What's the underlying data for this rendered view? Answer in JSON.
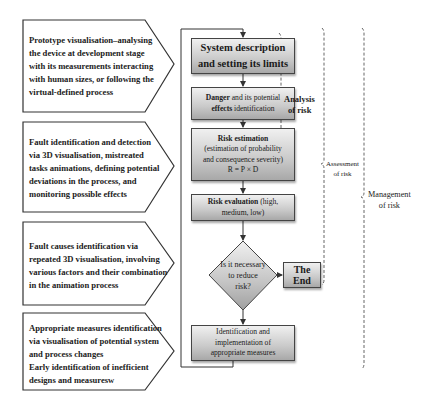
{
  "diagram": {
    "left_panels": [
      {
        "id": "prototype",
        "lines": [
          "Prototype visualisation–analysing",
          "the device at development stage",
          "with its measurements interacting",
          "with human sizes, or following the",
          "virtual-defined process"
        ]
      },
      {
        "id": "fault-identification",
        "lines": [
          "Fault identification and detection",
          "via 3D visualisation, mistreated",
          "tasks animations, defining potential",
          "deviations in the process, and",
          "monitoring possible effects"
        ]
      },
      {
        "id": "fault-causes",
        "lines": [
          "Fault causes identification via",
          "repeated 3D visualisation, involving",
          "various factors and their combination",
          "in the animation process"
        ]
      },
      {
        "id": "appropriate-measures",
        "lines": [
          "Appropriate measures identification",
          "via visualisation of potential system",
          "and process changes",
          "Early identification of inefficient",
          "designs and measuresw"
        ]
      }
    ],
    "flow": {
      "system_description": [
        "System description",
        "and setting its limits"
      ],
      "danger": {
        "bold1": "Danger",
        "rest1": " and its potential",
        "bold2": "effects",
        "rest2": " identification"
      },
      "risk_estimation": {
        "title": "Risk estimation",
        "lines": [
          "(estimation of probability",
          "and consequence severity)"
        ],
        "formula": "R = P × D"
      },
      "risk_evaluation": {
        "bold": "Risk evaluation",
        "rest1": " (high,",
        "line2": "medium, low)"
      },
      "decision": [
        "Is it necessary",
        "to reduce",
        "risk?"
      ],
      "end": "The End",
      "measures": [
        "Identification and",
        "implementation of",
        "appropriate measures"
      ]
    },
    "braces": {
      "analysis": [
        "Analysis",
        "of risk"
      ],
      "assessment": [
        "Assessment",
        "of risk"
      ],
      "management": [
        "Management",
        "of risk"
      ]
    },
    "colors": {
      "box_light": "#f0f0f0",
      "box_dark": "#a8a8a8",
      "line": "#333333"
    }
  }
}
